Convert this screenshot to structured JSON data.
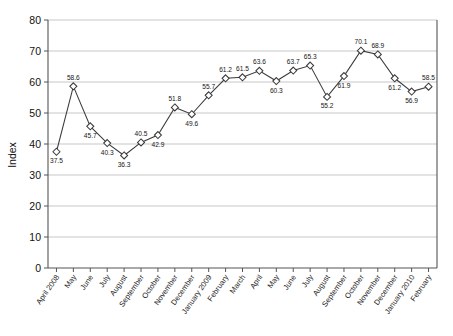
{
  "chart_data": {
    "type": "line",
    "title": "",
    "subtitle": "",
    "xlabel": "",
    "ylabel": "Index",
    "ylim": [
      0,
      80
    ],
    "ytick_step": 10,
    "yticks": [
      0,
      10,
      20,
      30,
      40,
      50,
      60,
      70,
      80
    ],
    "grid": true,
    "grid_axis": "y",
    "legend": false,
    "legend_position": "none",
    "marker": "diamond",
    "data_labels": true,
    "categories": [
      "April 2008",
      "May",
      "June",
      "July",
      "August",
      "September",
      "October",
      "November",
      "December",
      "January 2009",
      "February",
      "March",
      "April",
      "May",
      "June",
      "July",
      "August",
      "September",
      "October",
      "November",
      "December",
      "January 2010",
      "February"
    ],
    "values": [
      37.5,
      58.6,
      45.7,
      40.3,
      36.3,
      40.5,
      42.9,
      51.8,
      49.6,
      55.7,
      61.2,
      61.5,
      63.6,
      60.3,
      63.7,
      65.3,
      55.2,
      61.9,
      70.1,
      68.9,
      61.2,
      56.9,
      58.5
    ],
    "series": [
      {
        "name": "Index",
        "values": [
          37.5,
          58.6,
          45.7,
          40.3,
          36.3,
          40.5,
          42.9,
          51.8,
          49.6,
          55.7,
          61.2,
          61.5,
          63.6,
          60.3,
          63.7,
          65.3,
          55.2,
          61.9,
          70.1,
          68.9,
          61.2,
          56.9,
          58.5
        ],
        "color": "#3b3b3b"
      }
    ],
    "label_positions": [
      "below",
      "above",
      "below",
      "below",
      "below",
      "above",
      "below",
      "above",
      "below",
      "above",
      "above",
      "above",
      "above",
      "below",
      "above",
      "above",
      "below",
      "below",
      "above",
      "above",
      "below",
      "below",
      "above"
    ],
    "colors": {
      "line": "#3b3b3b",
      "marker_fill": "#ffffff",
      "marker_stroke": "#3b3b3b",
      "grid": "#b9b9b9",
      "axis": "#555555",
      "background": "#ffffff",
      "text": "#111111"
    }
  }
}
